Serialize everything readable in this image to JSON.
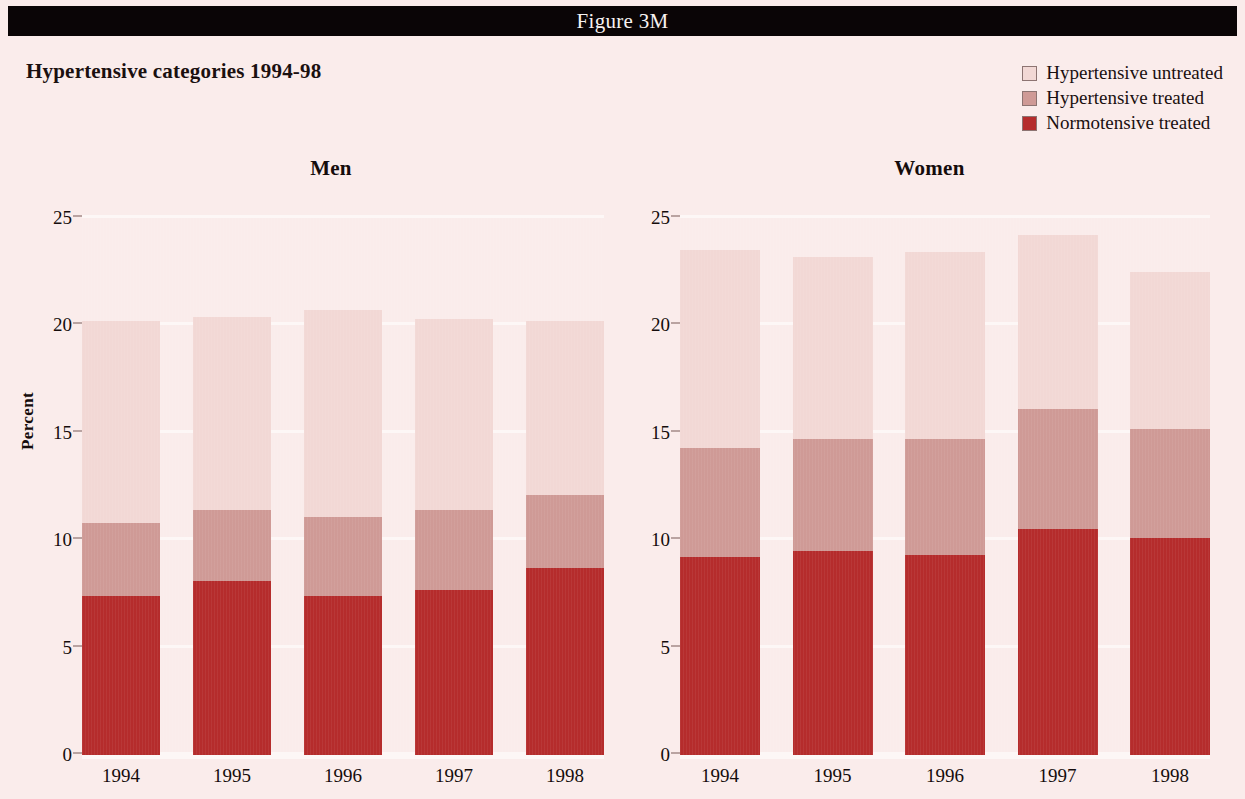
{
  "banner": {
    "figure_label": "Figure 3M"
  },
  "chart": {
    "title": "Hypertensive categories 1994-98"
  },
  "legend": {
    "items": [
      {
        "label": "Hypertensive untreated",
        "color": "#f2d8d5"
      },
      {
        "label": "Hypertensive treated",
        "color": "#cf9a96"
      },
      {
        "label": "Normotensive treated",
        "color": "#b52c2c"
      }
    ]
  },
  "colors": {
    "background": "#faeceb",
    "banner": "#0a0506",
    "hypertensive_untreated": "#f2d8d5",
    "hypertensive_treated": "#cf9a96",
    "normotensive_treated": "#b52c2c",
    "gridline": "#fdf7f6",
    "text": "#150c0c"
  },
  "chart_data": {
    "type": "bar",
    "title": "Hypertensive categories 1994-98",
    "subtype": "stacked",
    "xlabel": "",
    "ylabel": "Percent",
    "ylim": [
      0,
      25
    ],
    "yticks": [
      0,
      5,
      10,
      15,
      20,
      25
    ],
    "grid": true,
    "legend_position": "top-right",
    "categories": [
      "1994",
      "1995",
      "1996",
      "1997",
      "1998"
    ],
    "panels": [
      {
        "name": "Men",
        "series": [
          {
            "name": "Normotensive treated",
            "values": [
              7.4,
              8.1,
              7.4,
              7.7,
              8.7
            ]
          },
          {
            "name": "Hypertensive treated",
            "values": [
              3.4,
              3.3,
              3.7,
              3.7,
              3.4
            ]
          },
          {
            "name": "Hypertensive untreated",
            "values": [
              9.4,
              9.0,
              9.6,
              8.9,
              8.1
            ]
          }
        ],
        "cumulative_tops": {
          "Normotensive treated": [
            7.4,
            8.1,
            7.4,
            7.7,
            8.7
          ],
          "Hypertensive treated": [
            10.8,
            11.4,
            11.1,
            11.4,
            12.1
          ],
          "Hypertensive untreated": [
            20.2,
            20.4,
            20.7,
            20.3,
            20.2
          ]
        }
      },
      {
        "name": "Women",
        "series": [
          {
            "name": "Normotensive treated",
            "values": [
              9.2,
              9.5,
              9.3,
              10.5,
              10.1
            ]
          },
          {
            "name": "Hypertensive treated",
            "values": [
              5.1,
              5.2,
              5.4,
              5.6,
              5.1
            ]
          },
          {
            "name": "Hypertensive untreated",
            "values": [
              9.2,
              8.5,
              8.7,
              8.1,
              7.3
            ]
          }
        ],
        "cumulative_tops": {
          "Normotensive treated": [
            9.2,
            9.5,
            9.3,
            10.5,
            10.1
          ],
          "Hypertensive treated": [
            14.3,
            14.7,
            14.7,
            16.1,
            15.2
          ],
          "Hypertensive untreated": [
            23.5,
            23.2,
            23.4,
            24.2,
            22.5
          ]
        }
      }
    ]
  }
}
